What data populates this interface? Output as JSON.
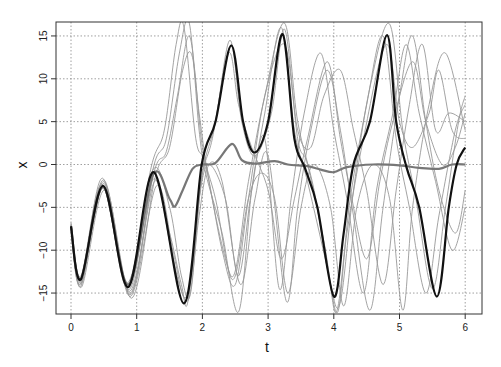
{
  "chart_data": {
    "type": "line",
    "title": "",
    "xlabel": "t",
    "ylabel": "x",
    "xlim": [
      -0.23,
      6.27
    ],
    "ylim": [
      -17.4,
      16.7
    ],
    "xticks": [
      0,
      1,
      2,
      3,
      4,
      5,
      6
    ],
    "yticks": [
      -15,
      -10,
      -5,
      0,
      5,
      10,
      15
    ],
    "grid": true,
    "grid_style": "dotted",
    "legend": null,
    "series": [
      {
        "name": "trajectory (true)",
        "color": "#111111",
        "width": 2.2,
        "points": [
          [
            0,
            -7.2
          ],
          [
            0.15,
            -13.4
          ],
          [
            0.49,
            -2.5
          ],
          [
            0.87,
            -14.3
          ],
          [
            1.26,
            -0.9
          ],
          [
            1.72,
            -16.2
          ],
          [
            1.99,
            0
          ],
          [
            2.2,
            5
          ],
          [
            2.44,
            13.9
          ],
          [
            2.62,
            5
          ],
          [
            2.79,
            1.4
          ],
          [
            3.0,
            5
          ],
          [
            3.22,
            15.2
          ],
          [
            3.4,
            3
          ],
          [
            3.56,
            -0.4
          ],
          [
            3.75,
            -5
          ],
          [
            4.0,
            -15.4
          ],
          [
            4.15,
            -8
          ],
          [
            4.3,
            0
          ],
          [
            4.55,
            5
          ],
          [
            4.81,
            15.1
          ],
          [
            4.95,
            5
          ],
          [
            5.11,
            -0.4
          ],
          [
            5.3,
            -5
          ],
          [
            5.57,
            -15.4
          ],
          [
            5.75,
            -5
          ],
          [
            5.87,
            0
          ],
          [
            6.0,
            2
          ]
        ]
      },
      {
        "name": "ensemble mean",
        "color": "#777777",
        "width": 2.2,
        "points": [
          [
            0,
            -7.2
          ],
          [
            0.15,
            -13.4
          ],
          [
            0.49,
            -2.6
          ],
          [
            0.87,
            -14.0
          ],
          [
            1.25,
            -1.2
          ],
          [
            1.5,
            -4.0
          ],
          [
            1.58,
            -4.9
          ],
          [
            1.7,
            -3.0
          ],
          [
            1.85,
            -0.5
          ],
          [
            2.0,
            0
          ],
          [
            2.2,
            0.2
          ],
          [
            2.45,
            2.4
          ],
          [
            2.6,
            0.5
          ],
          [
            2.8,
            0.1
          ],
          [
            3.1,
            0.4
          ],
          [
            3.3,
            0
          ],
          [
            3.6,
            -0.2
          ],
          [
            3.8,
            -0.6
          ],
          [
            4.0,
            -0.9
          ],
          [
            4.2,
            -0.3
          ],
          [
            4.6,
            0
          ],
          [
            5.0,
            -0.1
          ],
          [
            5.3,
            -0.4
          ],
          [
            5.6,
            -0.5
          ],
          [
            5.8,
            0
          ],
          [
            6.0,
            0
          ]
        ]
      },
      {
        "name": "ensemble member 1",
        "color": "#999999",
        "width": 0.9,
        "points": [
          [
            0,
            -7
          ],
          [
            0.15,
            -14
          ],
          [
            0.48,
            -1.6
          ],
          [
            0.9,
            -15.2
          ],
          [
            1.25,
            -0.5
          ],
          [
            1.45,
            3
          ],
          [
            1.65,
            13
          ],
          [
            1.8,
            16.5
          ],
          [
            1.95,
            4
          ],
          [
            2.05,
            -1
          ],
          [
            2.3,
            -8
          ],
          [
            2.55,
            -17.2
          ],
          [
            2.75,
            -3
          ],
          [
            2.95,
            6
          ],
          [
            3.2,
            16
          ],
          [
            3.4,
            4
          ],
          [
            3.6,
            -2
          ],
          [
            3.9,
            -12
          ],
          [
            4.05,
            -17
          ],
          [
            4.25,
            -4
          ],
          [
            4.5,
            7
          ],
          [
            4.75,
            15
          ],
          [
            4.95,
            3
          ],
          [
            5.15,
            -5
          ],
          [
            5.4,
            -15
          ],
          [
            5.6,
            -6
          ],
          [
            5.85,
            4
          ],
          [
            6.0,
            7
          ]
        ]
      },
      {
        "name": "ensemble member 2",
        "color": "#999999",
        "width": 0.9,
        "points": [
          [
            0,
            -7.4
          ],
          [
            0.15,
            -14.2
          ],
          [
            0.5,
            -2.0
          ],
          [
            0.92,
            -15.6
          ],
          [
            1.28,
            -1.5
          ],
          [
            1.5,
            2
          ],
          [
            1.7,
            11
          ],
          [
            1.85,
            12.5
          ],
          [
            2.0,
            2
          ],
          [
            2.2,
            -4
          ],
          [
            2.46,
            -13.1
          ],
          [
            2.7,
            -2
          ],
          [
            2.95,
            8
          ],
          [
            3.25,
            16.5
          ],
          [
            3.45,
            5
          ],
          [
            3.7,
            -3
          ],
          [
            3.95,
            -14
          ],
          [
            4.1,
            -16
          ],
          [
            4.3,
            -3
          ],
          [
            4.55,
            9
          ],
          [
            4.85,
            16.4
          ],
          [
            5.05,
            4
          ],
          [
            5.25,
            -4
          ],
          [
            5.5,
            -14.5
          ],
          [
            5.7,
            -5
          ],
          [
            5.9,
            5
          ],
          [
            6.0,
            8
          ]
        ]
      },
      {
        "name": "ensemble member 3",
        "color": "#999999",
        "width": 0.9,
        "points": [
          [
            0,
            -6.8
          ],
          [
            0.16,
            -13.8
          ],
          [
            0.5,
            -2.2
          ],
          [
            0.88,
            -14.6
          ],
          [
            1.24,
            -1.8
          ],
          [
            1.5,
            -8
          ],
          [
            1.68,
            -14
          ],
          [
            1.78,
            -16
          ],
          [
            1.95,
            -4
          ],
          [
            2.1,
            0
          ],
          [
            2.35,
            -4
          ],
          [
            2.55,
            -13
          ],
          [
            2.75,
            -3
          ],
          [
            2.95,
            3
          ],
          [
            3.17,
            -14.5
          ],
          [
            3.35,
            -4
          ],
          [
            3.55,
            6
          ],
          [
            3.8,
            13
          ],
          [
            4.0,
            4
          ],
          [
            4.2,
            -4
          ],
          [
            4.45,
            -15
          ],
          [
            4.65,
            -3
          ],
          [
            4.9,
            6
          ],
          [
            5.1,
            14
          ],
          [
            5.3,
            6
          ],
          [
            5.55,
            -2
          ],
          [
            5.8,
            -10
          ],
          [
            6.0,
            -5
          ]
        ]
      },
      {
        "name": "ensemble member 4",
        "color": "#999999",
        "width": 0.9,
        "points": [
          [
            0,
            -7.1
          ],
          [
            0.15,
            -13.6
          ],
          [
            0.49,
            -2.8
          ],
          [
            0.9,
            -15.0
          ],
          [
            1.27,
            -2.0
          ],
          [
            1.5,
            -9
          ],
          [
            1.65,
            -14
          ],
          [
            1.8,
            -15.5
          ],
          [
            1.95,
            -6
          ],
          [
            2.1,
            0
          ],
          [
            2.3,
            -2
          ],
          [
            2.58,
            -14
          ],
          [
            2.8,
            -4
          ],
          [
            3.0,
            1
          ],
          [
            3.28,
            -16
          ],
          [
            3.45,
            -5
          ],
          [
            3.65,
            4
          ],
          [
            3.9,
            11
          ],
          [
            4.1,
            4
          ],
          [
            4.3,
            -6
          ],
          [
            4.55,
            -17
          ],
          [
            4.75,
            -5
          ],
          [
            5.0,
            8
          ],
          [
            5.2,
            15
          ],
          [
            5.4,
            5
          ],
          [
            5.6,
            -3
          ],
          [
            5.85,
            -8
          ],
          [
            6.0,
            -3
          ]
        ]
      },
      {
        "name": "ensemble member 5",
        "color": "#999999",
        "width": 0.9,
        "points": [
          [
            0,
            -7.3
          ],
          [
            0.15,
            -13.0
          ],
          [
            0.47,
            -2.3
          ],
          [
            0.86,
            -13.8
          ],
          [
            1.22,
            -0.3
          ],
          [
            1.42,
            4
          ],
          [
            1.6,
            14
          ],
          [
            1.72,
            16
          ],
          [
            1.9,
            3
          ],
          [
            2.05,
            0
          ],
          [
            2.3,
            -10
          ],
          [
            2.5,
            -14
          ],
          [
            2.7,
            -4
          ],
          [
            2.95,
            8
          ],
          [
            3.25,
            14
          ],
          [
            3.45,
            4
          ],
          [
            3.65,
            2
          ],
          [
            3.85,
            8
          ],
          [
            4.1,
            11
          ],
          [
            4.3,
            4
          ],
          [
            4.5,
            -3
          ],
          [
            4.75,
            -14
          ],
          [
            4.95,
            -3
          ],
          [
            5.15,
            7
          ],
          [
            5.35,
            14
          ],
          [
            5.55,
            4
          ],
          [
            5.75,
            6
          ],
          [
            6.0,
            5
          ]
        ]
      },
      {
        "name": "ensemble member 6",
        "color": "#999999",
        "width": 0.9,
        "points": [
          [
            0,
            -6.9
          ],
          [
            0.15,
            -13.2
          ],
          [
            0.5,
            -1.8
          ],
          [
            0.89,
            -14.8
          ],
          [
            1.26,
            -1.0
          ],
          [
            1.45,
            1.5
          ],
          [
            1.62,
            8
          ],
          [
            1.8,
            15
          ],
          [
            1.95,
            6
          ],
          [
            2.1,
            -2
          ],
          [
            2.35,
            -11
          ],
          [
            2.5,
            -13
          ],
          [
            2.7,
            -4
          ],
          [
            2.9,
            -1
          ],
          [
            3.1,
            -4
          ],
          [
            3.3,
            -15
          ],
          [
            3.5,
            -5
          ],
          [
            3.7,
            0
          ],
          [
            3.95,
            -5
          ],
          [
            4.15,
            -16.5
          ],
          [
            4.35,
            -5
          ],
          [
            4.6,
            0
          ],
          [
            4.85,
            -4
          ],
          [
            5.05,
            -17
          ],
          [
            5.2,
            -5
          ],
          [
            5.45,
            7
          ],
          [
            5.7,
            13
          ],
          [
            6.0,
            4
          ]
        ]
      },
      {
        "name": "ensemble member 7",
        "color": "#999999",
        "width": 0.9,
        "points": [
          [
            0,
            -7.5
          ],
          [
            0.16,
            -14.3
          ],
          [
            0.51,
            -3.0
          ],
          [
            0.9,
            -15.4
          ],
          [
            1.3,
            -2.5
          ],
          [
            1.55,
            -10
          ],
          [
            1.72,
            -15.5
          ],
          [
            1.85,
            -12
          ],
          [
            2.0,
            -1
          ],
          [
            2.2,
            5
          ],
          [
            2.42,
            14.5
          ],
          [
            2.6,
            5
          ],
          [
            2.8,
            1
          ],
          [
            3.05,
            6
          ],
          [
            3.25,
            15.8
          ],
          [
            3.45,
            3
          ],
          [
            3.6,
            0
          ],
          [
            3.85,
            -9
          ],
          [
            4.05,
            -17.3
          ],
          [
            4.2,
            -8
          ],
          [
            4.45,
            3
          ],
          [
            4.8,
            14
          ],
          [
            5.0,
            5
          ],
          [
            5.2,
            2
          ],
          [
            5.45,
            6
          ],
          [
            5.6,
            11
          ],
          [
            5.8,
            4
          ],
          [
            6.0,
            3
          ]
        ]
      },
      {
        "name": "ensemble member 8",
        "color": "#999999",
        "width": 0.9,
        "points": [
          [
            0,
            -7.2
          ],
          [
            0.14,
            -13.9
          ],
          [
            0.48,
            -2.4
          ],
          [
            0.86,
            -14.4
          ],
          [
            1.24,
            -0.7
          ],
          [
            1.5,
            -5
          ],
          [
            1.68,
            -13
          ],
          [
            1.82,
            -15
          ],
          [
            1.98,
            -2
          ],
          [
            2.15,
            3
          ],
          [
            2.4,
            13
          ],
          [
            2.55,
            7
          ],
          [
            2.75,
            2
          ],
          [
            3.0,
            -3
          ],
          [
            3.2,
            -11
          ],
          [
            3.4,
            -4
          ],
          [
            3.6,
            3
          ],
          [
            3.9,
            12
          ],
          [
            4.1,
            3
          ],
          [
            4.25,
            -3
          ],
          [
            4.5,
            -11
          ],
          [
            4.7,
            -2
          ],
          [
            4.9,
            5
          ],
          [
            5.2,
            12
          ],
          [
            5.4,
            5
          ],
          [
            5.65,
            0
          ],
          [
            5.85,
            2
          ],
          [
            6.0,
            6
          ]
        ]
      }
    ]
  }
}
